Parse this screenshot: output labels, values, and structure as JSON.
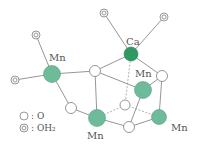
{
  "diagram": {
    "colors": {
      "mn": "#6dbb98",
      "ca": "#2e9a62",
      "bond": "#8a8a8a"
    },
    "labels": {
      "ca": "Ca",
      "mn_left": "Mn",
      "mn_right_upper": "Mn",
      "mn_bottom": "Mn",
      "mn_right_lower": "Mn"
    },
    "legend": [
      {
        "symbol": "circle",
        "label": ": O"
      },
      {
        "symbol": "double-circle",
        "label": ": OH₂"
      }
    ]
  }
}
